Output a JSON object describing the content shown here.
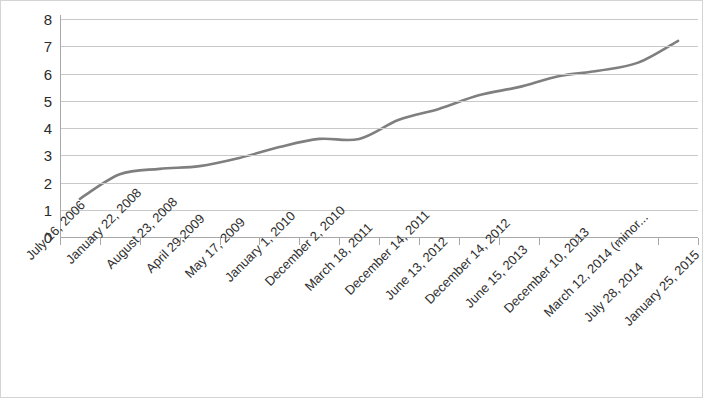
{
  "chart_data": {
    "type": "line",
    "title": "",
    "xlabel": "",
    "ylabel": "",
    "ylim": [
      0,
      8
    ],
    "ytick_labels": [
      "8",
      "7",
      "6",
      "5",
      "4",
      "3",
      "2",
      "1",
      "0"
    ],
    "yticks": [
      8,
      7,
      6,
      5,
      4,
      3,
      2,
      1,
      0
    ],
    "grid": true,
    "legend": "none",
    "line_color": "#7f7f7f",
    "categories": [
      "July 16, 2006",
      "January 22, 2008",
      "August 23, 2008",
      "April 29,2009",
      "May 17, 2009",
      "January 1, 2010",
      "December 2, 2010",
      "March 18, 2011",
      "December 14, 2011",
      "June 13, 2012",
      "December 14, 2012",
      "June 15, 2013",
      "December 10, 2013",
      "March 12, 2014 (minor...",
      "July 28, 2014",
      "January 25, 2015"
    ],
    "values": [
      1.4,
      2.3,
      2.5,
      2.6,
      2.9,
      3.3,
      3.6,
      3.6,
      4.3,
      4.7,
      5.2,
      5.5,
      5.9,
      6.1,
      6.4,
      7.2
    ]
  }
}
